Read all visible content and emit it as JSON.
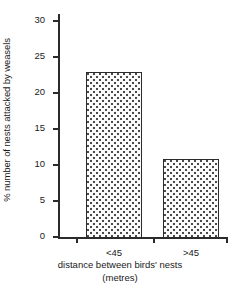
{
  "chart_data": {
    "type": "bar",
    "title": "",
    "subtitle": "",
    "categories": [
      "<45",
      ">45"
    ],
    "values": [
      23,
      11
    ],
    "series": [
      {
        "name": "% number of nests attacked by weasels",
        "values": [
          23,
          11
        ]
      }
    ],
    "xlabel": "distance between birds' nests",
    "xlabel_units": "(metres)",
    "ylabel": "% number of nests attacked by weasels",
    "ylim": [
      0,
      30
    ],
    "ytick_labels": [
      "0",
      "5",
      "10",
      "15",
      "20",
      "25",
      "30"
    ],
    "ytick_values": [
      0,
      5,
      10,
      15,
      20,
      25,
      30
    ],
    "grid": false,
    "legend": false,
    "legend_position": "none",
    "bar_fill": "stippled-dots",
    "colors": {
      "axis": "#2b2b2b",
      "bar_outline": "#2b2b2b",
      "bar_fill": "#fbfbfb",
      "bar_dots": "#4a4a4a",
      "text": "#1a1a1a",
      "background": "#ffffff"
    }
  },
  "axes": {
    "y": {
      "label": "% number of nests attacked by weasels",
      "ticks": [
        {
          "label": "30",
          "value": 30
        },
        {
          "label": "25",
          "value": 25
        },
        {
          "label": "20",
          "value": 20
        },
        {
          "label": "15",
          "value": 15
        },
        {
          "label": "10",
          "value": 10
        },
        {
          "label": "5",
          "value": 5
        },
        {
          "label": "0",
          "value": 0
        }
      ]
    },
    "x": {
      "caption_line1": "distance between birds' nests",
      "caption_line2": "(metres)",
      "ticks": [
        {
          "label": "<45",
          "value": 23
        },
        {
          "label": ">45",
          "value": 11
        }
      ]
    }
  }
}
